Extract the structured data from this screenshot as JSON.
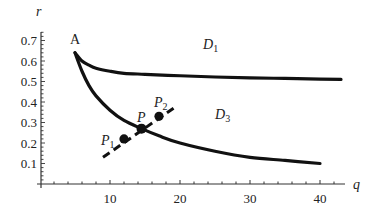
{
  "chart_data": {
    "type": "line",
    "title": "",
    "xlabel": "q",
    "ylabel": "r",
    "xlim": [
      0,
      44
    ],
    "ylim": [
      0,
      0.75
    ],
    "x_ticks": [
      10,
      20,
      30,
      40
    ],
    "x_tick_labels": [
      "10",
      "20",
      "30",
      "40"
    ],
    "y_ticks": [
      0.1,
      0.2,
      0.3,
      0.4,
      0.5,
      0.6,
      0.7
    ],
    "y_tick_labels": [
      "0.1",
      "0.2",
      "0.3",
      "0.4",
      "0.5",
      "0.6",
      "0.7"
    ],
    "grid": false,
    "legend": null,
    "series": [
      {
        "name": "upper boundary (D1 / D3)",
        "style": "solid-thick",
        "x": [
          5,
          6,
          7,
          8,
          10,
          12,
          15,
          20,
          25,
          30,
          35,
          40,
          43
        ],
        "y": [
          0.64,
          0.6,
          0.58,
          0.565,
          0.55,
          0.54,
          0.535,
          0.528,
          0.522,
          0.518,
          0.515,
          0.512,
          0.51
        ]
      },
      {
        "name": "lower boundary",
        "style": "solid-thick",
        "x": [
          5,
          6,
          7,
          8,
          10,
          12,
          14.5,
          17,
          20,
          25,
          30,
          35,
          40
        ],
        "y": [
          0.64,
          0.55,
          0.48,
          0.43,
          0.36,
          0.31,
          0.27,
          0.235,
          0.2,
          0.16,
          0.13,
          0.115,
          0.1
        ]
      },
      {
        "name": "segment P1-P2",
        "style": "dashed",
        "x": [
          9,
          19.5
        ],
        "y": [
          0.13,
          0.38
        ]
      }
    ],
    "points": [
      {
        "label": "A",
        "x": 5,
        "y": 0.64,
        "marker": "none"
      },
      {
        "label": "P",
        "x": 14.5,
        "y": 0.27,
        "marker": "dot"
      },
      {
        "label": "P1",
        "x": 12,
        "y": 0.22,
        "marker": "dot"
      },
      {
        "label": "P2",
        "x": 17,
        "y": 0.33,
        "marker": "dot"
      }
    ],
    "annotations": [
      {
        "text": "D1",
        "x": 23,
        "y": 0.66
      },
      {
        "text": "D3",
        "x": 30,
        "y": 0.35
      },
      {
        "text": "A",
        "x": 5,
        "y": 0.69
      }
    ]
  },
  "labels": {
    "x_axis": "q",
    "y_axis": "r",
    "A": "A",
    "D1_main": "D",
    "D1_sub": "1",
    "D3_main": "D",
    "D3_sub": "3",
    "P": "P",
    "P1_main": "P",
    "P1_sub": "1",
    "P2_main": "P",
    "P2_sub": "2"
  }
}
